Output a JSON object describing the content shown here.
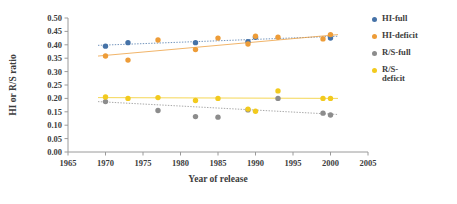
{
  "chart_data": {
    "type": "scatter",
    "title": "",
    "xlabel": "Year of release",
    "ylabel": "HI or R/S ratio",
    "xlim": [
      1965,
      2005
    ],
    "ylim": [
      0.0,
      0.5
    ],
    "xticks": [
      1965,
      1970,
      1975,
      1980,
      1985,
      1990,
      1995,
      2000,
      2005
    ],
    "yticks": [
      "0.00",
      "0.05",
      "0.10",
      "0.15",
      "0.20",
      "0.25",
      "0.30",
      "0.35",
      "0.40",
      "0.45",
      "0.50"
    ],
    "grid": false,
    "legend_position": "right",
    "series": [
      {
        "name": "HI-full",
        "color": "#4572a7",
        "marker": "circle",
        "trendline": {
          "visible": true,
          "style": "dotted",
          "x": [
            1969,
            2001
          ],
          "y": [
            0.398,
            0.432
          ]
        },
        "points": [
          {
            "x": 1970,
            "y": 0.395
          },
          {
            "x": 1973,
            "y": 0.408
          },
          {
            "x": 1982,
            "y": 0.408
          },
          {
            "x": 1989,
            "y": 0.412
          },
          {
            "x": 1990,
            "y": 0.428
          },
          {
            "x": 2000,
            "y": 0.425
          }
        ]
      },
      {
        "name": "HI-deficit",
        "color": "#ed9c38",
        "marker": "circle",
        "trendline": {
          "visible": true,
          "style": "solid",
          "x": [
            1969,
            2001
          ],
          "y": [
            0.358,
            0.438
          ]
        },
        "points": [
          {
            "x": 1970,
            "y": 0.358
          },
          {
            "x": 1973,
            "y": 0.343
          },
          {
            "x": 1977,
            "y": 0.418
          },
          {
            "x": 1982,
            "y": 0.382
          },
          {
            "x": 1985,
            "y": 0.425
          },
          {
            "x": 1989,
            "y": 0.403
          },
          {
            "x": 1990,
            "y": 0.432
          },
          {
            "x": 1993,
            "y": 0.428
          },
          {
            "x": 1999,
            "y": 0.422
          },
          {
            "x": 2000,
            "y": 0.438
          }
        ]
      },
      {
        "name": "R/S-full",
        "color": "#8c8c8c",
        "marker": "circle",
        "trendline": {
          "visible": true,
          "style": "dotted",
          "x": [
            1969,
            2001
          ],
          "y": [
            0.188,
            0.14
          ]
        },
        "points": [
          {
            "x": 1970,
            "y": 0.188
          },
          {
            "x": 1977,
            "y": 0.155
          },
          {
            "x": 1982,
            "y": 0.132
          },
          {
            "x": 1985,
            "y": 0.13
          },
          {
            "x": 1989,
            "y": 0.157
          },
          {
            "x": 1993,
            "y": 0.2
          },
          {
            "x": 1999,
            "y": 0.145
          },
          {
            "x": 2000,
            "y": 0.138
          }
        ]
      },
      {
        "name": "R/S-deficit",
        "color": "#f2ca1e",
        "marker": "circle",
        "trendline": {
          "visible": true,
          "style": "solid",
          "x": [
            1969,
            2001
          ],
          "y": [
            0.203,
            0.2
          ]
        },
        "points": [
          {
            "x": 1970,
            "y": 0.205
          },
          {
            "x": 1973,
            "y": 0.2
          },
          {
            "x": 1977,
            "y": 0.203
          },
          {
            "x": 1982,
            "y": 0.192
          },
          {
            "x": 1985,
            "y": 0.2
          },
          {
            "x": 1989,
            "y": 0.16
          },
          {
            "x": 1990,
            "y": 0.152
          },
          {
            "x": 1993,
            "y": 0.228
          },
          {
            "x": 1999,
            "y": 0.2
          },
          {
            "x": 2000,
            "y": 0.2
          }
        ]
      }
    ]
  },
  "legend": {
    "items": [
      {
        "label": "HI-full",
        "color": "#4572a7"
      },
      {
        "label": "HI-deficit",
        "color": "#ed9c38"
      },
      {
        "label": "R/S-full",
        "color": "#8c8c8c"
      },
      {
        "label": "R/S-\ndeficit",
        "color": "#f2ca1e"
      }
    ]
  }
}
